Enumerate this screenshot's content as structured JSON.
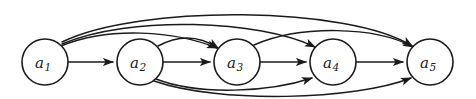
{
  "figure": {
    "kind": "directed-graph-diagram",
    "title": "",
    "background_color": "#ffffff",
    "line_color": "#1a1a1a",
    "node_fill_color": "#ffffff",
    "width": 476,
    "height": 99
  },
  "graph": {
    "type": "complete-dag",
    "node_count": 5,
    "edge_count": 10,
    "nodes": [
      {
        "id": "a1",
        "label": "a",
        "subscript": "1",
        "cx": 45,
        "cy": 62,
        "r": 23
      },
      {
        "id": "a2",
        "label": "a",
        "subscript": "2",
        "cx": 140,
        "cy": 62,
        "r": 23
      },
      {
        "id": "a3",
        "label": "a",
        "subscript": "3",
        "cx": 237,
        "cy": 62,
        "r": 23
      },
      {
        "id": "a4",
        "label": "a",
        "subscript": "4",
        "cx": 333,
        "cy": 62,
        "r": 23
      },
      {
        "id": "a5",
        "label": "a",
        "subscript": "5",
        "cx": 430,
        "cy": 62,
        "r": 23
      }
    ],
    "edges": [
      {
        "from": "a1",
        "to": "a2",
        "style": "straight",
        "side": "middle",
        "path": "M 68.5,62 L 113,62"
      },
      {
        "from": "a2",
        "to": "a3",
        "style": "straight",
        "side": "middle",
        "path": "M 163.5,62 L 210,62"
      },
      {
        "from": "a3",
        "to": "a4",
        "style": "straight",
        "side": "middle",
        "path": "M 260.5,62 L 306,62"
      },
      {
        "from": "a4",
        "to": "a5",
        "style": "straight",
        "side": "middle",
        "path": "M 356.5,62 L 403,62"
      },
      {
        "from": "a1",
        "to": "a3",
        "style": "arc",
        "side": "top",
        "path": "M 61,46 C 110,26 175,31 217,48"
      },
      {
        "from": "a1",
        "to": "a4",
        "style": "arc",
        "side": "top",
        "path": "M 62,44 C 130,15 260,20 315,47"
      },
      {
        "from": "a1",
        "to": "a5",
        "style": "arc",
        "side": "top",
        "path": "M 62,42 C 140,4 350,6 412,46"
      },
      {
        "from": "a2",
        "to": "a3",
        "style": "arc",
        "side": "top",
        "path": "M 158,46 C 180,34 200,36 218,48"
      },
      {
        "from": "a3",
        "to": "a5",
        "style": "arc",
        "side": "top",
        "path": "M 254,45 C 300,25 375,26 413,47"
      },
      {
        "from": "a2",
        "to": "a4",
        "style": "arc",
        "side": "bottom",
        "path": "M 156,79 C 200,96 270,92 312,78"
      },
      {
        "from": "a2",
        "to": "a5",
        "style": "arc",
        "side": "bottom",
        "path": "M 154,81 C 220,104 355,100 411,78"
      }
    ]
  }
}
